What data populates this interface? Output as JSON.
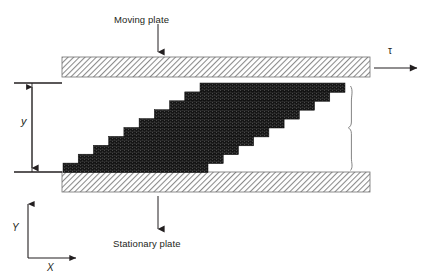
{
  "figure": {
    "background_color": "#ffffff",
    "width": 425,
    "height": 278
  },
  "labels": {
    "moving_plate": "Moving plate",
    "stationary_plate": "Stationary plate",
    "shear_stress_symbol": "τ",
    "gap_symbol": "y",
    "axis_y": "Y",
    "axis_x": "X"
  },
  "colors": {
    "plate_hatch": "#8a8a8a",
    "plate_outline": "#6f6f6f",
    "fluid_fill": "#1a1a1a",
    "fluid_speckle": "#454545",
    "line": "#231f20",
    "text": "#231f20",
    "brace": "#6d6d6d"
  },
  "elements": {
    "moving_plate": {
      "x": 62,
      "y": 57,
      "width": 308,
      "height": 20,
      "hatch_angle_deg": 45,
      "label_arrow_from_y": 24,
      "label_arrow_to_y": 56
    },
    "stationary_plate": {
      "x": 62,
      "y": 172,
      "width": 308,
      "height": 20,
      "hatch_angle_deg": 45,
      "label_arrow_from_y": 196,
      "label_arrow_to_y": 232
    },
    "fluid_parallelogram": {
      "top_left_x": 200,
      "top_right_x": 345,
      "bottom_left_x": 63,
      "bottom_right_x": 208,
      "top_y": 83,
      "bottom_y": 172,
      "step_count": 10,
      "step_height": 8.9,
      "step_offset_x": 13.7
    },
    "gap_dimension": {
      "arrow_x": 32,
      "top_y": 83,
      "bottom_y": 172,
      "tick_left_x": 14,
      "tick_right_x": 62,
      "label_x": 22,
      "label_y": 122
    },
    "shear_arrow": {
      "from_x": 374,
      "to_x": 420,
      "y": 68,
      "symbol_x": 393,
      "symbol_y": 53
    },
    "right_brace": {
      "x": 352,
      "top_y": 86,
      "bottom_y": 170
    },
    "axis_indicator": {
      "origin_x": 28,
      "origin_y": 258,
      "y_tip_y": 200,
      "x_tip_x": 80,
      "y_label_x": 14,
      "y_label_y": 229,
      "x_label_x": 50,
      "x_label_y": 270
    }
  }
}
